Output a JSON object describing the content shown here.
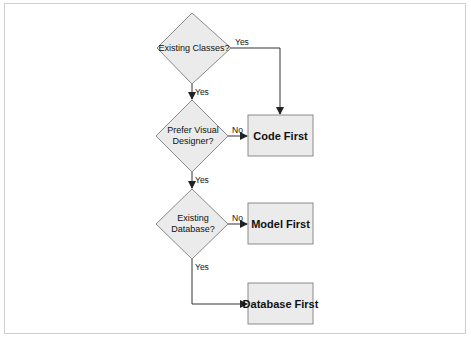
{
  "diagram": {
    "type": "flowchart",
    "colors": {
      "node_fill": "#ebebeb",
      "node_stroke": "#8a8a8a",
      "edge": "#333333",
      "frame": "#cfcfcf"
    },
    "decisions": [
      {
        "id": "d1",
        "lines": [
          "Existing Classes?"
        ]
      },
      {
        "id": "d2",
        "lines": [
          "Prefer Visual",
          "Designer?"
        ]
      },
      {
        "id": "d3",
        "lines": [
          "Existing",
          "Database?"
        ]
      }
    ],
    "outcomes": [
      {
        "id": "code_first",
        "label": "Code First"
      },
      {
        "id": "model_first",
        "label": "Model First"
      },
      {
        "id": "database_first",
        "label": "Database First"
      }
    ],
    "edges": [
      {
        "from": "d1",
        "to": "code_first",
        "label": "Yes"
      },
      {
        "from": "d1",
        "to": "d2",
        "label": "Yes"
      },
      {
        "from": "d2",
        "to": "code_first",
        "label": "No"
      },
      {
        "from": "d2",
        "to": "d3",
        "label": "Yes"
      },
      {
        "from": "d3",
        "to": "model_first",
        "label": "No"
      },
      {
        "from": "d3",
        "to": "database_first",
        "label": "Yes"
      }
    ]
  }
}
